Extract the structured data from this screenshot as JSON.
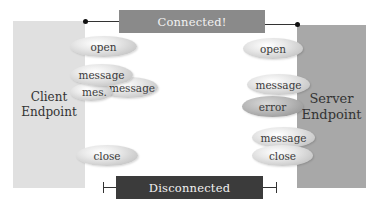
{
  "client": {
    "label_line1": "Client",
    "label_line2": "Endpoint",
    "color": "#e0e0e0"
  },
  "server": {
    "label_line1": "Server",
    "label_line2": "Endpoint",
    "color": "#a8a8a8"
  },
  "connected_bar": {
    "label": "Connected!",
    "color": "#8a8a8a"
  },
  "disconnected_bar": {
    "label": "Disconnected",
    "color": "#3b3b3b"
  },
  "client_events": [
    {
      "label": "open"
    },
    {
      "label": "message"
    },
    {
      "label": "message"
    },
    {
      "label": "mes."
    },
    {
      "label": "close"
    }
  ],
  "server_events": [
    {
      "label": "open"
    },
    {
      "label": "message"
    },
    {
      "label": "error"
    },
    {
      "label": "message"
    },
    {
      "label": "close"
    }
  ]
}
